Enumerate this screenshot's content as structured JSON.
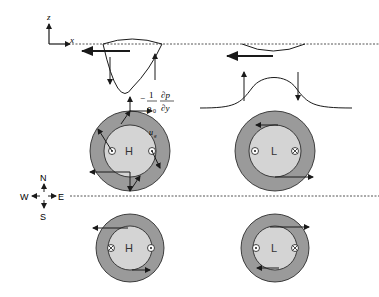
{
  "axes": {
    "z_label": "z",
    "x_label": "x"
  },
  "pressure_gradient": {
    "minus": "−",
    "numerator_1": "1",
    "denominator_1": "ρ",
    "denominator_1_sub": "0",
    "numerator_2": "∂p",
    "denominator_2": "∂y"
  },
  "velocity_label": {
    "main": "u",
    "sub": "g"
  },
  "compass": {
    "north": "N",
    "south": "S",
    "east": "E",
    "west": "W"
  },
  "eddies": {
    "top_left": {
      "center_label": "H",
      "left_symbol": "out-of-page",
      "right_symbol": "out-of-page"
    },
    "top_right": {
      "center_label": "L",
      "left_symbol": "out-of-page",
      "right_symbol": "into-page"
    },
    "bottom_left": {
      "center_label": "H",
      "left_symbol": "into-page",
      "right_symbol": "out-of-page"
    },
    "bottom_right": {
      "center_label": "L",
      "left_symbol": "out-of-page",
      "right_symbol": "into-page"
    }
  },
  "colors": {
    "outer_ring": "#9a9a9a",
    "inner_disk": "#d4d4d4",
    "line": "#1a1a1a",
    "dashed": "#555555"
  }
}
